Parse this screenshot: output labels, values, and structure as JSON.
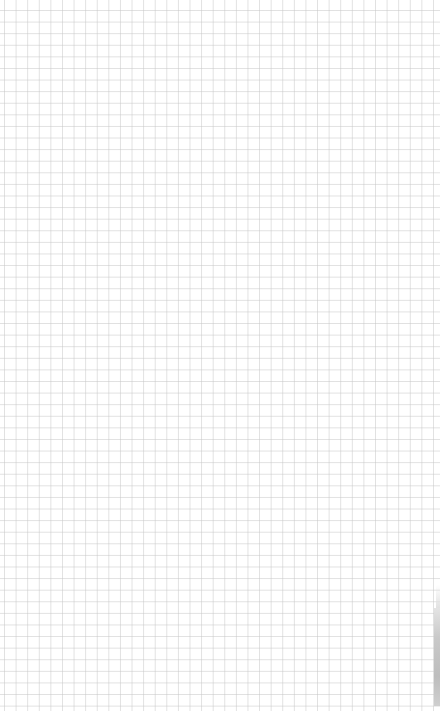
{
  "canvas": {
    "type": "grid-paper",
    "background_color": "#ffffff",
    "grid_line_color": "#dcdcdc",
    "grid_spacing_px": 11.6
  },
  "edge_element": {
    "description": "gray vertical bar at right edge",
    "color": "#c4c4c4"
  }
}
